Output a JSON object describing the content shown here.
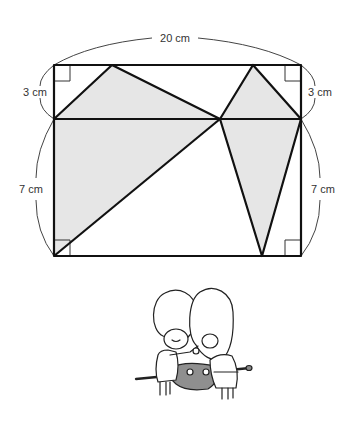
{
  "diagram": {
    "labels": {
      "top_width": "20 cm",
      "left_top_height": "3 cm",
      "right_top_height": "3 cm",
      "left_bottom_height": "7 cm",
      "right_bottom_height": "7 cm"
    },
    "colors": {
      "stroke": "#111111",
      "shade": "#e6e6e6",
      "arc": "#444444",
      "text": "#333333"
    },
    "rectangle": {
      "width_cm": 20,
      "height_cm": 10,
      "top_band_cm": 3,
      "bottom_band_cm": 7
    },
    "shaded_regions": [
      "upper-left triangle",
      "upper-right triangle",
      "lower-left triangle",
      "lower-right triangle"
    ],
    "right_angle_markers": [
      "top-left",
      "top-right",
      "bottom-left",
      "bottom-right"
    ]
  },
  "illustration": {
    "description": "two hooded children holding a cloth bundle on a stick"
  }
}
